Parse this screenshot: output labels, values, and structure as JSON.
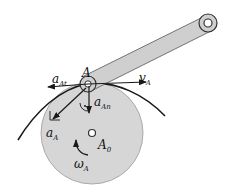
{
  "diagram": {
    "type": "kinematics",
    "colors": {
      "disk_fill": "#d6d6d6",
      "link_fill": "#cfcfcf",
      "stroke": "#1a1a1a",
      "background": "#ffffff"
    },
    "labels": {
      "point_A": {
        "main": "A",
        "sub": ""
      },
      "a_At": {
        "main": "a",
        "sub": "At"
      },
      "v_A": {
        "main": "v",
        "sub": "A"
      },
      "a_An": {
        "main": "a",
        "sub": "An"
      },
      "a_A": {
        "main": "a",
        "sub": "A"
      },
      "A0": {
        "main": "A",
        "sub": "0"
      },
      "omega_A": {
        "main": "ω",
        "sub": "A"
      }
    }
  }
}
